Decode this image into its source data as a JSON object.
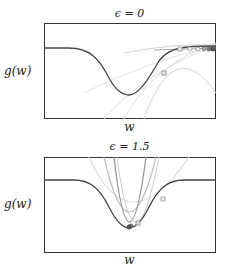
{
  "panels": [
    {
      "title": "ϵ = 0",
      "ylabel": "g(w)",
      "xlabel": "w"
    },
    {
      "title": "ϵ = 1.5",
      "ylabel": "g(w)",
      "xlabel": "w"
    }
  ],
  "colors": {
    "frame": "#333333",
    "curve": "#444444",
    "approx_light": "#cccccc",
    "approx_mid": "#999999",
    "point_light": "#bbbbbb",
    "point_dark": "#555555"
  }
}
